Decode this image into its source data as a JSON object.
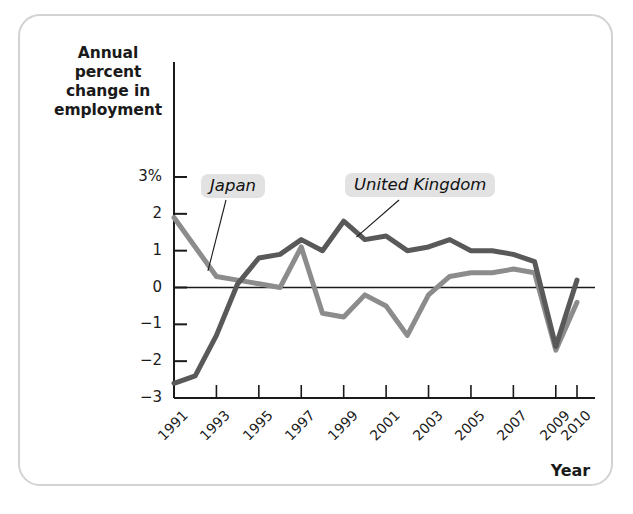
{
  "figure": {
    "y_axis_title": "Annual percent change in employment",
    "x_axis_title": "Year"
  },
  "series_labels": {
    "japan": "Japan",
    "united_kingdom": "United Kingdom"
  },
  "axes": {
    "y_ticks": [
      "3%",
      "2",
      "1",
      "0",
      "−1",
      "−2",
      "−3"
    ],
    "x_ticks": [
      "1991",
      "1993",
      "1995",
      "1997",
      "1999",
      "2001",
      "2003",
      "2005",
      "2007",
      "2009",
      "2010"
    ]
  },
  "colors": {
    "united_kingdom": "#595959",
    "japan": "#8c8c8c",
    "axis": "#1a1a1a",
    "label_background": "#e2e2e2",
    "frame_border": "#d2d2d2"
  },
  "chart_data": {
    "type": "line",
    "title": "",
    "xlabel": "Year",
    "ylabel": "Annual percent change in employment",
    "x": [
      1991,
      1992,
      1993,
      1994,
      1995,
      1996,
      1997,
      1998,
      1999,
      2000,
      2001,
      2002,
      2003,
      2004,
      2005,
      2006,
      2007,
      2008,
      2009,
      2010
    ],
    "xlim": [
      1991,
      2010
    ],
    "ylim": [
      -3,
      3
    ],
    "yticks": [
      -3,
      -2,
      -1,
      0,
      1,
      2,
      3
    ],
    "xticks": [
      1991,
      1993,
      1995,
      1997,
      1999,
      2001,
      2003,
      2005,
      2007,
      2009,
      2010
    ],
    "grid": false,
    "legend": "inline-annotations",
    "series": [
      {
        "name": "Japan",
        "color": "#8c8c8c",
        "values": [
          1.9,
          1.1,
          0.3,
          0.2,
          0.1,
          0.0,
          1.1,
          -0.7,
          -0.8,
          -0.2,
          -0.5,
          -1.3,
          -0.2,
          0.3,
          0.4,
          0.4,
          0.5,
          0.4,
          -1.7,
          -0.4
        ]
      },
      {
        "name": "United Kingdom",
        "color": "#595959",
        "values": [
          -2.6,
          -2.4,
          -1.3,
          0.1,
          0.8,
          0.9,
          1.3,
          1.0,
          1.8,
          1.3,
          1.4,
          1.0,
          1.1,
          1.3,
          1.0,
          1.0,
          0.9,
          0.7,
          -1.6,
          0.2
        ]
      }
    ],
    "annotations": [
      {
        "text": "Japan",
        "points_to_series": "Japan",
        "x": 1992.6
      },
      {
        "text": "United Kingdom",
        "points_to_series": "United Kingdom",
        "x": 1999.6
      }
    ]
  }
}
